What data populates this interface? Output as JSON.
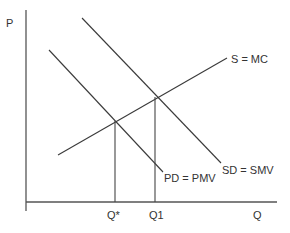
{
  "diagram": {
    "type": "economics-supply-demand-externality",
    "axes": {
      "y_label": "P",
      "x_label": "Q"
    },
    "curves": [
      {
        "id": "supply",
        "label": "S = MC",
        "kind": "upward-sloping"
      },
      {
        "id": "social_demand",
        "label": "SD = SMV",
        "kind": "downward-sloping"
      },
      {
        "id": "private_demand",
        "label": "PD = PMV",
        "kind": "downward-sloping"
      }
    ],
    "equilibria": [
      {
        "id": "q_star",
        "label": "Q*",
        "intersection": [
          "supply",
          "private_demand"
        ]
      },
      {
        "id": "q1",
        "label": "Q1",
        "intersection": [
          "supply",
          "social_demand"
        ]
      }
    ],
    "colors": {
      "lines": "#3a3a3a",
      "axes": "#555555",
      "text": "#333333"
    }
  }
}
